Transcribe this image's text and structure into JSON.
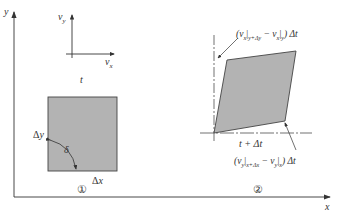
{
  "diagram": {
    "type": "fluid-element-deformation",
    "colors": {
      "line": "#333333",
      "fill": "#b3b3b3",
      "background": "#ffffff"
    },
    "axes": {
      "x_label": "x",
      "y_label": "y"
    },
    "velocity_axes": {
      "vy_label": "v",
      "vy_sub": "y",
      "vx_label": "v",
      "vx_sub": "x"
    },
    "state1": {
      "time_label": "t",
      "marker": "①",
      "dx_label": "Δx",
      "dy_label": "Δy",
      "angle_label": "δ"
    },
    "state2": {
      "time_label": "t + Δt",
      "marker": "②",
      "top_annotation": {
        "open": "(v",
        "sub1": "x",
        "bar1": "|",
        "eval1": "y+Δy",
        "minus": " − v",
        "sub2": "x",
        "bar2": "|",
        "eval2": "y",
        "close": ") Δt"
      },
      "bottom_annotation": {
        "open": "(v",
        "sub1": "y",
        "bar1": "|",
        "eval1": "x+Δx",
        "minus": " − v",
        "sub2": "y",
        "bar2": "|",
        "eval2": "x",
        "close": ") Δt"
      }
    }
  }
}
